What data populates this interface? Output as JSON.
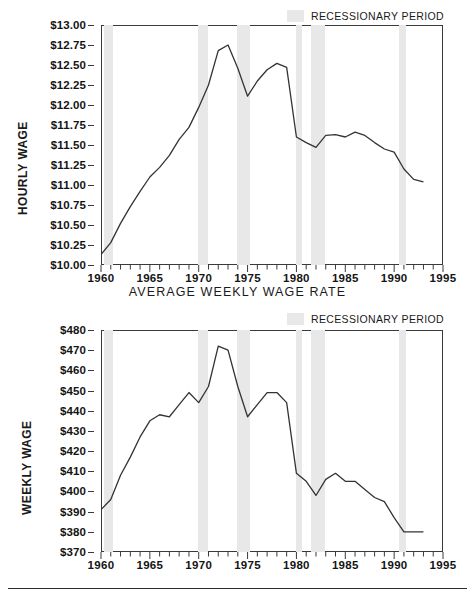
{
  "legend": {
    "label": "RECESSIONARY PERIOD",
    "swatch_color": "#e8e8e8",
    "position": "top-right"
  },
  "caption_between_charts": "AVERAGE WEEKLY WAGE RATE",
  "chart_data": [
    {
      "id": "hourly-wage",
      "type": "line",
      "title": "",
      "xlabel": "",
      "ylabel": "HOURLY WAGE",
      "xlim": [
        1960,
        1995
      ],
      "ylim": [
        10.0,
        13.0
      ],
      "grid": false,
      "legend_position": "top-right",
      "legend_entries": [
        "RECESSIONARY PERIOD"
      ],
      "ytick_labels": [
        "$13.00",
        "$12.75",
        "$12.50",
        "$12.25",
        "$12.00",
        "$11.75",
        "$11.50",
        "$11.25",
        "$11.00",
        "$10.75",
        "$10.50",
        "$10.25",
        "$10.00"
      ],
      "ytick_values": [
        13.0,
        12.75,
        12.5,
        12.25,
        12.0,
        11.75,
        11.5,
        11.25,
        11.0,
        10.75,
        10.5,
        10.25,
        10.0
      ],
      "xtick_labels": [
        "1960",
        "1965",
        "1970",
        "1975",
        "1980",
        "1985",
        "1990",
        "1995"
      ],
      "xtick_values": [
        1960,
        1965,
        1970,
        1975,
        1980,
        1985,
        1990,
        1995
      ],
      "minor_xtick_step": 1,
      "line_color": "#333333",
      "x": [
        1960,
        1961,
        1962,
        1963,
        1964,
        1965,
        1966,
        1967,
        1968,
        1969,
        1970,
        1971,
        1972,
        1973,
        1974,
        1975,
        1976,
        1977,
        1978,
        1979,
        1980,
        1981,
        1982,
        1983,
        1984,
        1985,
        1986,
        1987,
        1988,
        1989,
        1990,
        1991,
        1992,
        1993
      ],
      "values": [
        10.13,
        10.28,
        10.52,
        10.73,
        10.92,
        11.1,
        11.22,
        11.37,
        11.57,
        11.72,
        11.97,
        12.25,
        12.68,
        12.75,
        12.46,
        12.11,
        12.3,
        12.44,
        12.52,
        12.47,
        11.6,
        11.53,
        11.47,
        11.62,
        11.63,
        11.6,
        11.66,
        11.62,
        11.53,
        11.45,
        11.41,
        11.2,
        11.07,
        11.04
      ],
      "recession_bands": [
        {
          "start": 1960.3,
          "end": 1961.2
        },
        {
          "start": 1969.9,
          "end": 1970.9
        },
        {
          "start": 1973.9,
          "end": 1975.2
        },
        {
          "start": 1980.0,
          "end": 1980.6
        },
        {
          "start": 1981.5,
          "end": 1982.9
        },
        {
          "start": 1990.5,
          "end": 1991.2
        }
      ]
    },
    {
      "id": "weekly-wage",
      "type": "line",
      "title": "",
      "xlabel": "",
      "ylabel": "WEEKLY WAGE",
      "xlim": [
        1960,
        1995
      ],
      "ylim": [
        370,
        480
      ],
      "grid": false,
      "legend_position": "top-right",
      "legend_entries": [
        "RECESSIONARY PERIOD"
      ],
      "ytick_labels": [
        "$480",
        "$470",
        "$460",
        "$450",
        "$440",
        "$430",
        "$420",
        "$410",
        "$400",
        "$390",
        "$380",
        "$370"
      ],
      "ytick_values": [
        480,
        470,
        460,
        450,
        440,
        430,
        420,
        410,
        400,
        390,
        380,
        370
      ],
      "xtick_labels": [
        "1960",
        "1965",
        "1970",
        "1975",
        "1980",
        "1985",
        "1990",
        "1995"
      ],
      "xtick_values": [
        1960,
        1965,
        1970,
        1975,
        1980,
        1985,
        1990,
        1995
      ],
      "minor_xtick_step": 1,
      "line_color": "#333333",
      "x": [
        1960,
        1961,
        1962,
        1963,
        1964,
        1965,
        1966,
        1967,
        1968,
        1969,
        1970,
        1971,
        1972,
        1973,
        1974,
        1975,
        1976,
        1977,
        1978,
        1979,
        1980,
        1981,
        1982,
        1983,
        1984,
        1985,
        1986,
        1987,
        1988,
        1989,
        1990,
        1991,
        1992,
        1993
      ],
      "values": [
        391,
        396,
        408,
        417,
        427,
        435,
        438,
        437,
        443,
        449,
        444,
        452,
        472,
        470,
        452,
        437,
        443,
        449,
        449,
        444,
        409,
        405,
        398,
        406,
        409,
        405,
        405,
        401,
        397,
        395,
        387,
        380,
        380,
        380
      ],
      "recession_bands": [
        {
          "start": 1960.3,
          "end": 1961.2
        },
        {
          "start": 1969.9,
          "end": 1970.9
        },
        {
          "start": 1973.9,
          "end": 1975.2
        },
        {
          "start": 1980.0,
          "end": 1980.6
        },
        {
          "start": 1981.5,
          "end": 1982.9
        },
        {
          "start": 1990.5,
          "end": 1991.2
        }
      ]
    }
  ]
}
